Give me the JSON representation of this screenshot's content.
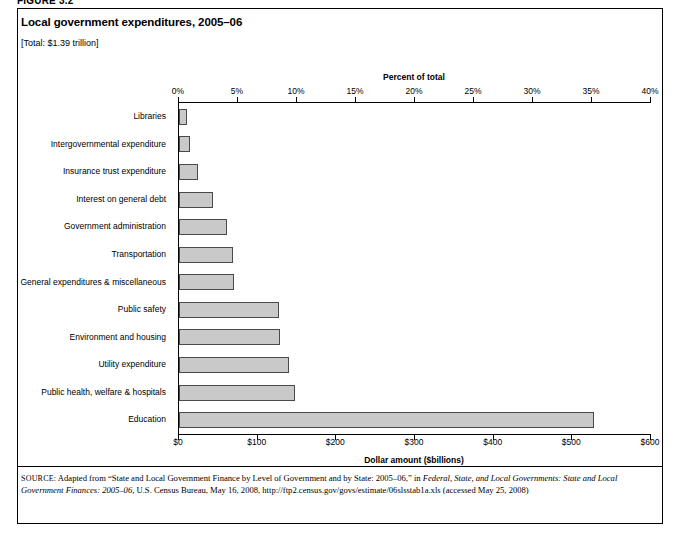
{
  "figure_label": "FIGURE 3.2",
  "title": "Local government expenditures, 2005–06",
  "subtitle": "[Total: $1.39 trillion]",
  "top_axis_title": "Percent of total",
  "bottom_axis_title": "Dollar amount ($billions)",
  "top_ticks": [
    "0%",
    "5%",
    "10%",
    "15%",
    "20%",
    "25%",
    "30%",
    "35%",
    "40%"
  ],
  "bottom_ticks": [
    "$0",
    "$100",
    "$200",
    "$300",
    "$400",
    "$500",
    "$600"
  ],
  "colors": {
    "bar_fill": "#c9c9c9",
    "bar_stroke": "#4a4a4a",
    "axis": "#000000",
    "frame": "#000000"
  },
  "source": {
    "prefix": "SOURCE:",
    "line1_a": " Adapted from “State and Local Government Finance by Level of Government and by State: 2005–06,” in ",
    "line1_italic": "Federal, State, and Local Governments:",
    "line2_italic": "State and Local Government Finances: 2005–06",
    "line2_b": ", U.S. Census Bureau, May 16, 2008, http://ftp2.census.gov/govs/estimate/06slsstab1a.xls",
    "line3": "(accessed May 25, 2008)"
  },
  "chart_data": {
    "type": "bar",
    "orientation": "horizontal",
    "title": "Local government expenditures, 2005–06",
    "subtitle": "[Total: $1.39 trillion]",
    "xlabel": "Dollar amount ($billions)",
    "xlabel_secondary": "Percent of total",
    "ylabel": "",
    "xlim": [
      0,
      600
    ],
    "xlim_percent": [
      0,
      40
    ],
    "xticks": [
      0,
      100,
      200,
      300,
      400,
      500,
      600
    ],
    "xticks_percent": [
      0,
      5,
      10,
      15,
      20,
      25,
      30,
      35,
      40
    ],
    "grid": false,
    "legend": "none",
    "categories": [
      "Libraries",
      "Intergovernmental expenditure",
      "Insurance trust expenditure",
      "Interest on general debt",
      "Government administration",
      "Transportation",
      "General expenditures & miscellaneous",
      "Public safety",
      "Environment and housing",
      "Utility expenditure",
      "Public health, welfare & hospitals",
      "Education"
    ],
    "values": [
      10,
      14,
      24,
      43,
      61,
      69,
      70,
      127,
      128,
      140,
      148,
      528
    ],
    "values_unit": "$billions",
    "values_percent": [
      0.7,
      1.0,
      1.7,
      3.1,
      4.4,
      5.0,
      5.0,
      9.1,
      9.2,
      10.1,
      10.6,
      38.0
    ]
  }
}
